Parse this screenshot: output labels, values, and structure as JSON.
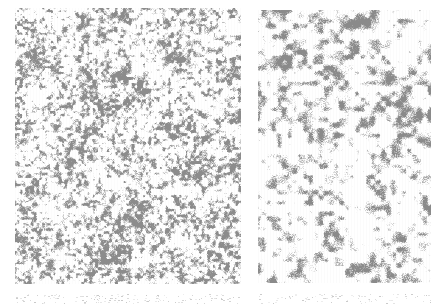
{
  "canvas": {
    "width": 431,
    "height": 307,
    "background": "#ffffff"
  },
  "panels": [
    {
      "id": "left",
      "label": "",
      "x": 15,
      "y": 8,
      "width": 226,
      "height": 276,
      "texture": "fine-speckle",
      "base_color": "#ffffff",
      "speck_color": "#8c8c8c",
      "density": 0.34,
      "blob_scale": 1.4,
      "seed": 17,
      "dark_regions": [
        {
          "cx": 0.42,
          "cy": 0.38,
          "r": 0.28,
          "gain": 0.35
        },
        {
          "cx": 0.78,
          "cy": 0.58,
          "r": 0.22,
          "gain": 0.25
        },
        {
          "cx": 0.5,
          "cy": 0.92,
          "r": 0.3,
          "gain": 0.3
        }
      ]
    },
    {
      "id": "right",
      "label": "",
      "x": 258,
      "y": 10,
      "width": 173,
      "height": 273,
      "texture": "coarse-blotch",
      "base_color": "#ffffff",
      "speck_color": "#8a8a8a",
      "density": 0.3,
      "blob_scale": 2.6,
      "seed": 53,
      "dark_regions": [
        {
          "cx": 0.3,
          "cy": 0.15,
          "r": 0.3,
          "gain": 0.3
        },
        {
          "cx": 0.45,
          "cy": 0.55,
          "r": 0.25,
          "gain": 0.2
        }
      ]
    }
  ],
  "bottom_strips": [
    {
      "x": 15,
      "y": 294,
      "width": 226,
      "height": 10,
      "density": 0.06,
      "seed": 91
    },
    {
      "x": 258,
      "y": 294,
      "width": 173,
      "height": 10,
      "density": 0.05,
      "seed": 97
    }
  ]
}
